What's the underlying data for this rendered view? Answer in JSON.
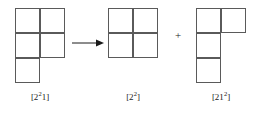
{
  "figure": {
    "type": "young-diagram-branching",
    "cell_size": 25,
    "line_color": "#5a5a5a",
    "text_color": "#1a1a1a",
    "background": "#ffffff",
    "operator_plus": "+",
    "arrow_label": ""
  },
  "diagrams": [
    {
      "id": "source",
      "partition": [
        2,
        2,
        1
      ],
      "rows": [
        2,
        2,
        1
      ],
      "label_main": "[2",
      "label_sup": "2",
      "label_tail": "1]",
      "label_plain": "[2^2 1]",
      "x": 15,
      "y": 8,
      "caption_y": 92
    },
    {
      "id": "result-1",
      "partition": [
        2,
        2
      ],
      "rows": [
        2,
        2
      ],
      "label_main": "[2",
      "label_sup": "2",
      "label_tail": "]",
      "label_plain": "[2^2]",
      "x": 108,
      "y": 8,
      "caption_y": 92
    },
    {
      "id": "result-2",
      "partition": [
        2,
        1,
        1
      ],
      "rows": [
        2,
        1,
        1
      ],
      "label_main": "[21",
      "label_sup": "2",
      "label_tail": "]",
      "label_plain": "[21^2]",
      "x": 196,
      "y": 8,
      "caption_y": 92
    }
  ],
  "arrow": {
    "x": 72,
    "y": 34,
    "length": 30
  },
  "plus": {
    "x": 175,
    "y": 30
  }
}
